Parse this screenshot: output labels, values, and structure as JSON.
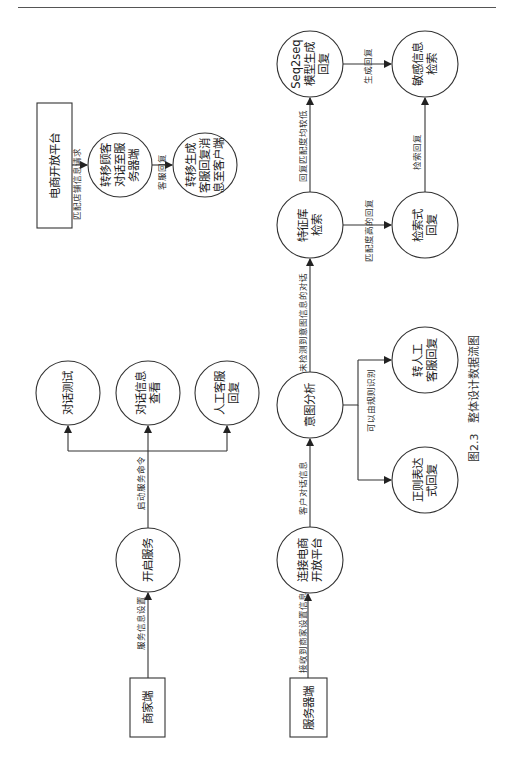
{
  "header": {
    "running_title": ""
  },
  "figure": {
    "caption_number": "图2.3",
    "caption_title": "整体设计数据流图",
    "orientation": "rotated-90-ccw"
  },
  "nodes": {
    "platform_box": {
      "label": "电商开放平台",
      "shape": "rect"
    },
    "transfer_to_server": {
      "lines": [
        "转移顾客",
        "对话至服",
        "务器端"
      ],
      "shape": "circle"
    },
    "transfer_reply": {
      "lines": [
        "转移生成",
        "客服回复消",
        "息至客户端"
      ],
      "shape": "circle"
    },
    "seq2seq": {
      "lines": [
        "Seq2seq",
        "模型生成",
        "回复"
      ],
      "shape": "circle"
    },
    "sensitive_check": {
      "lines": [
        "敏感信息",
        "检索"
      ],
      "shape": "circle"
    },
    "feature_lib": {
      "lines": [
        "特征库",
        "检索"
      ],
      "shape": "circle"
    },
    "retrieval_reply": {
      "lines": [
        "检索式",
        "回复"
      ],
      "shape": "circle"
    },
    "manual_transfer": {
      "lines": [
        "转人工",
        "客服回复"
      ],
      "shape": "circle"
    },
    "intent": {
      "lines": [
        "意图分析"
      ],
      "shape": "circle"
    },
    "regex_reply": {
      "lines": [
        "正则表达",
        "式回复"
      ],
      "shape": "circle"
    },
    "connect_platform": {
      "lines": [
        "连接电商",
        "开放平台"
      ],
      "shape": "circle"
    },
    "server_box": {
      "label": "服务器端",
      "shape": "rect"
    },
    "dialog_test": {
      "lines": [
        "对话测试"
      ],
      "shape": "circle"
    },
    "dialog_view": {
      "lines": [
        "对话信息",
        "查看"
      ],
      "shape": "circle"
    },
    "manual_reply": {
      "lines": [
        "人工客服",
        "回复"
      ],
      "shape": "circle"
    },
    "start_service": {
      "lines": [
        "开启服务"
      ],
      "shape": "circle"
    },
    "merchant_box": {
      "label": "商家端",
      "shape": "rect"
    }
  },
  "edges": {
    "platform_to_transfer": "匹配店铺信息请求",
    "transfer_to_reply": "客服回复",
    "seq2seq_to_sensitive": "生成回复",
    "feature_to_seq2seq": "回复匹配度均较低",
    "retrieval_to_sensitive": "检索回复",
    "feature_to_retrieval": "匹配度高的回复",
    "intent_to_feature": "未检测到意图信息的对话",
    "intent_to_rules": "可以由规则识别",
    "connect_to_intent": "客户对话信息",
    "server_to_connect": "接收到商家设置信息",
    "start_to_functions": "启动服务命令",
    "merchant_to_start": "服务信息设置"
  }
}
